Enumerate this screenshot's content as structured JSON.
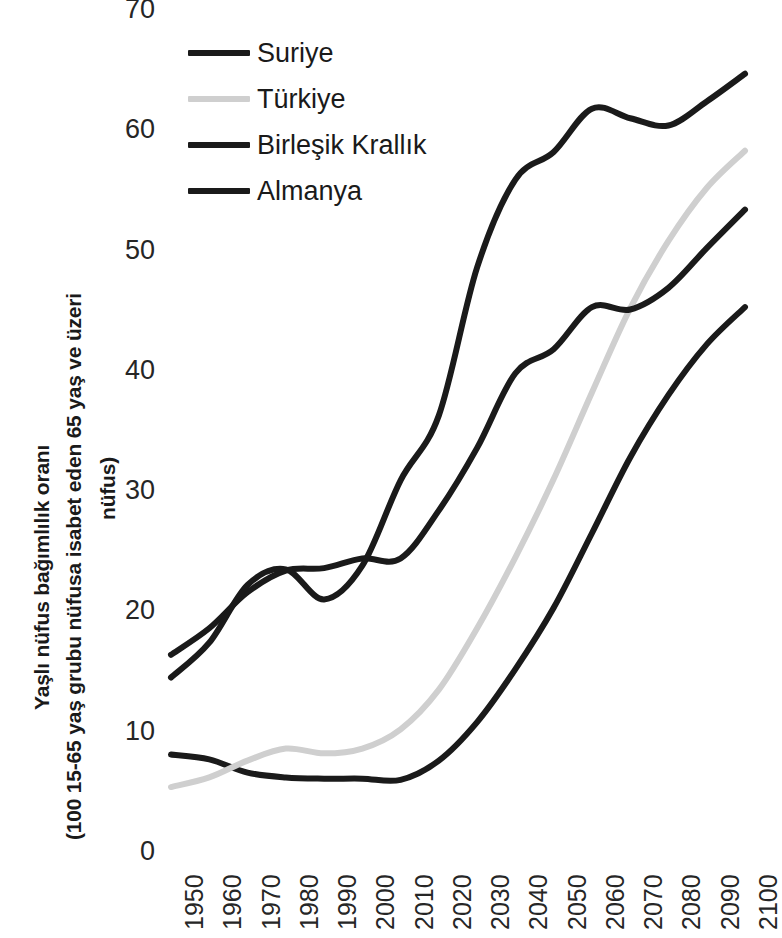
{
  "chart_data": {
    "type": "line",
    "title": "",
    "xlabel": "",
    "ylabel": "Yaşlı nüfus bağımlılık oranı (100 15-65 yaş grubu nüfusa isabet eden 65 yaş ve üzeri nüfus)",
    "ylabel_lines": [
      "Yaşlı nüfus bağımlılık oranı",
      "(100 15-65 yaş grubu nüfusa isabet eden 65 yaş ve üzeri",
      "nüfus)"
    ],
    "x": [
      1950,
      1960,
      1970,
      1980,
      1990,
      2000,
      2010,
      2020,
      2030,
      2040,
      2050,
      2060,
      2070,
      2080,
      2090,
      2100
    ],
    "categories": [
      "1950",
      "1960",
      "1970",
      "1980",
      "1990",
      "2000",
      "2010",
      "2020",
      "2030",
      "2040",
      "2050",
      "2060",
      "2070",
      "2080",
      "2090",
      "2100"
    ],
    "xlim": [
      1950,
      2100
    ],
    "ylim": [
      0,
      70
    ],
    "yticks": [
      0,
      10,
      20,
      30,
      40,
      50,
      60,
      70
    ],
    "grid": false,
    "legend_position": "top-left-inside",
    "series": [
      {
        "name": "Suriye",
        "color": "#1a1a1a",
        "values": [
          8.1,
          7.7,
          6.6,
          6.2,
          6.1,
          6.1,
          6.0,
          7.6,
          10.8,
          15.2,
          20.3,
          26.5,
          32.8,
          38.0,
          42.2,
          45.3
        ]
      },
      {
        "name": "Türkiye",
        "color": "#cfcfcf",
        "values": [
          5.4,
          6.2,
          7.6,
          8.6,
          8.2,
          8.6,
          10.2,
          13.5,
          18.6,
          24.5,
          31.0,
          38.2,
          45.2,
          50.8,
          55.2,
          58.3
        ]
      },
      {
        "name": "Birleşik Krallık",
        "color": "#1a1a1a",
        "values": [
          16.4,
          18.6,
          21.6,
          23.4,
          23.6,
          24.4,
          24.4,
          28.4,
          33.6,
          39.8,
          41.8,
          45.3,
          45.1,
          46.9,
          50.2,
          53.4
        ]
      },
      {
        "name": "Almanya",
        "color": "#1a1a1a",
        "values": [
          14.5,
          17.4,
          22.2,
          23.5,
          21.0,
          23.8,
          30.9,
          36.3,
          48.6,
          55.9,
          58.2,
          61.8,
          61.0,
          60.4,
          62.4,
          64.7
        ]
      }
    ]
  },
  "legend": {
    "items": [
      {
        "label": "Suriye",
        "color": "#1a1a1a"
      },
      {
        "label": "Türkiye",
        "color": "#cfcfcf"
      },
      {
        "label": "Birleşik Krallık",
        "color": "#1a1a1a"
      },
      {
        "label": "Almanya",
        "color": "#1a1a1a"
      }
    ]
  }
}
